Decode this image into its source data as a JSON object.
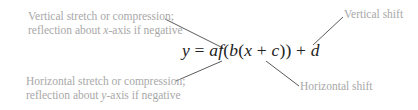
{
  "equation": {
    "y": "y",
    "equals": " = ",
    "a": "a",
    "f": "f",
    "open1": "(",
    "b": "b",
    "open2": "(",
    "x": "x",
    "plus1": " + ",
    "c": "c",
    "close": "))",
    "plus2": " + ",
    "d": "d"
  },
  "labels": {
    "top_left": {
      "line1": "Vertical stretch or compression;",
      "line2_pre": "reflection about ",
      "line2_var": "x",
      "line2_post": "-axis if negative"
    },
    "top_right": "Vertical shift",
    "bottom_left": {
      "line1": "Horizontal stretch or compression;",
      "line2_pre": "reflection about ",
      "line2_var": "y",
      "line2_post": "-axis if negative"
    },
    "bottom_right": "Horizontal shift"
  },
  "colors": {
    "label_text": "#a8a8a8",
    "equation_text": "#222222",
    "leader_line": "#5a5a5a"
  }
}
